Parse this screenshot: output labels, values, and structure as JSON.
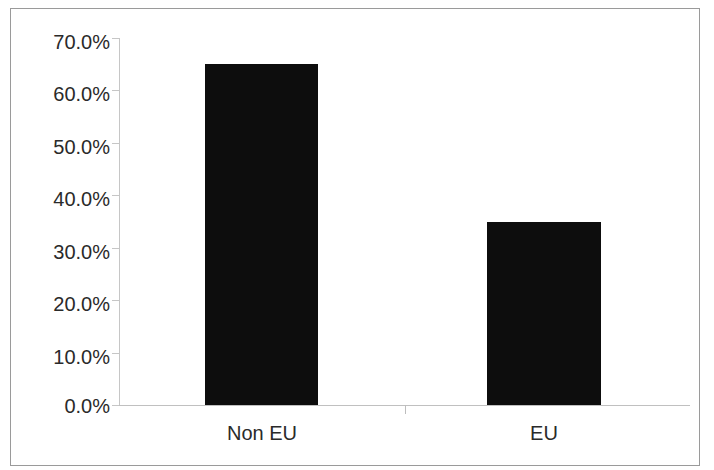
{
  "chart_data": {
    "type": "bar",
    "title": "",
    "subtitle": "",
    "xlabel": "",
    "ylabel": "",
    "categories": [
      "Non EU",
      "EU"
    ],
    "values": [
      0.65,
      0.35
    ],
    "value_labels": [
      "65.0%",
      "35.0%"
    ],
    "series": [
      {
        "name": "Share",
        "values": [
          0.65,
          0.35
        ]
      }
    ],
    "ylim": [
      0,
      0.7
    ],
    "ytick_values": [
      0.0,
      0.1,
      0.2,
      0.3,
      0.4,
      0.5,
      0.6,
      0.7
    ],
    "ytick_labels": [
      "0.0%",
      "10.0%",
      "20.0%",
      "30.0%",
      "40.0%",
      "50.0%",
      "60.0%",
      "70.0%"
    ],
    "grid": false,
    "legend": false,
    "legend_position": "none",
    "bar_color": "#0d0d0d",
    "axis_color": "#c0c0c0",
    "text_color": "#2a2a2a",
    "background_color": "#ffffff",
    "border_color": "#9a9a9a"
  },
  "axis": {
    "y_labels": {
      "t70": "70.0%",
      "t60": "60.0%",
      "t50": "50.0%",
      "t40": "40.0%",
      "t30": "30.0%",
      "t20": "20.0%",
      "t10": "10.0%",
      "t0": "0.0%"
    },
    "x_labels": {
      "cat0": "Non EU",
      "cat1": "EU"
    }
  }
}
